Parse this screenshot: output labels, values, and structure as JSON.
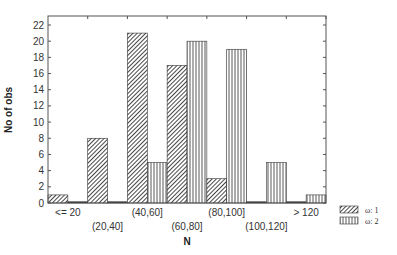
{
  "chart_data": {
    "type": "bar",
    "title": "",
    "xlabel": "N",
    "ylabel": "No of obs",
    "ylim": [
      0,
      22
    ],
    "yticks": [
      0,
      2,
      4,
      6,
      8,
      10,
      12,
      14,
      16,
      18,
      20,
      22
    ],
    "grid": false,
    "legend_position": "right-bottom",
    "categories": [
      "<= 20",
      "(20,40]",
      "(40,60]",
      "(60,80]",
      "(80,100]",
      "(100,120]",
      "> 120"
    ],
    "series": [
      {
        "name": "ω: 1",
        "pattern": "diagonal-hatch",
        "values": [
          1,
          8,
          21,
          17,
          3,
          0,
          0
        ]
      },
      {
        "name": "ω: 2",
        "pattern": "vertical-lines",
        "values": [
          0,
          0,
          5,
          20,
          19,
          5,
          1
        ]
      }
    ]
  }
}
